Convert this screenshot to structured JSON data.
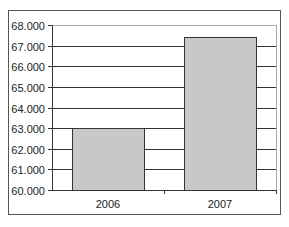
{
  "chart_data": {
    "type": "bar",
    "title": "",
    "xlabel": "",
    "ylabel": "",
    "categories": [
      "2006",
      "2007"
    ],
    "values": [
      63000,
      67400
    ],
    "ylim": [
      60000,
      68000
    ],
    "yticks": [
      "60.000",
      "61.000",
      "62.000",
      "63.000",
      "64.000",
      "65.000",
      "66.000",
      "67.000",
      "68.000"
    ],
    "grid": true,
    "legend": "none",
    "bar_color": "#c8c8c8",
    "bar_edge_color": "#333333",
    "gridline_color": "#333333"
  }
}
